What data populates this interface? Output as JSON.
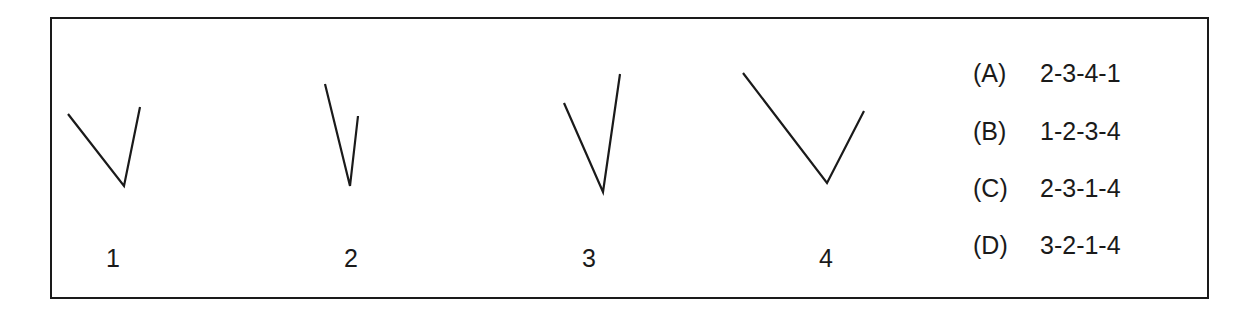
{
  "figures": [
    {
      "label": "1",
      "left_arm": [
        68,
        114
      ],
      "vertex": [
        124,
        186
      ],
      "right_arm": [
        140,
        107
      ],
      "label_pos": [
        113,
        246
      ]
    },
    {
      "label": "2",
      "left_arm": [
        325,
        84
      ],
      "vertex": [
        350,
        186
      ],
      "right_arm": [
        358,
        116
      ],
      "label_pos": [
        351,
        246
      ]
    },
    {
      "label": "3",
      "left_arm": [
        564,
        103
      ],
      "vertex": [
        603,
        192
      ],
      "right_arm": [
        620,
        74
      ],
      "label_pos": [
        589,
        246
      ]
    },
    {
      "label": "4",
      "left_arm": [
        743,
        73
      ],
      "vertex": [
        827,
        183
      ],
      "right_arm": [
        864,
        111
      ],
      "label_pos": [
        826,
        246
      ]
    }
  ],
  "options": [
    {
      "key": "(A)",
      "value": "2-3-4-1"
    },
    {
      "key": "(B)",
      "value": "1-2-3-4"
    },
    {
      "key": "(C)",
      "value": "2-3-1-4"
    },
    {
      "key": "(D)",
      "value": "3-2-1-4"
    }
  ],
  "colors": {
    "stroke": "#1a1a1a",
    "background": "#ffffff"
  }
}
